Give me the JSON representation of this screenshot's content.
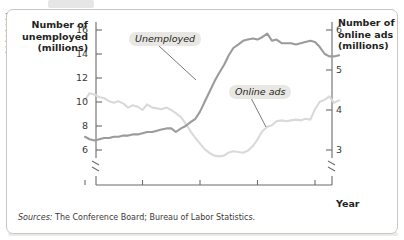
{
  "figure": {
    "panel_border_color": "#c9c6c2",
    "background": "#ffffff"
  },
  "source_note": {
    "lead": "Sources:",
    "text": " The Conference Board; Bureau of Labor Statistics."
  },
  "chart_data": {
    "type": "line",
    "title": "",
    "xlabel": "Year",
    "grid": false,
    "legend_position": "inline-annotations",
    "x_ticks": [
      "2007",
      "2008",
      "2009",
      "2010",
      "2011"
    ],
    "x_tick_values": [
      2007,
      2008,
      2009,
      2010,
      2011
    ],
    "xlim": [
      2006.92,
      2011.55
    ],
    "axis_break_x": true,
    "axes": [
      {
        "side": "left",
        "label": "Number of\nunemployed\n(millions)",
        "label_lines": [
          "Number of",
          "unemployed",
          "(millions)"
        ],
        "ticks": [
          16,
          14,
          12,
          10,
          8,
          6
        ],
        "tick_labels": [
          "16",
          "14",
          "12",
          "10",
          "8",
          "6"
        ],
        "lim": [
          5.0,
          17.0
        ],
        "axis_break": true
      },
      {
        "side": "right",
        "label": "Number of\nonline ads\n(millions)",
        "label_lines": [
          "Number of",
          "online ads",
          "(millions)"
        ],
        "ticks": [
          6,
          5,
          4,
          3
        ],
        "tick_labels": [
          "6",
          "5",
          "4",
          "3"
        ],
        "lim": [
          2.5,
          6.5
        ],
        "axis_break": true
      }
    ],
    "series": [
      {
        "name": "Unemployed",
        "annotation": "Unemployed",
        "axis": "left",
        "color": "#9b9b9b",
        "unit": "millions",
        "x": [
          2007.0,
          2007.08,
          2007.17,
          2007.25,
          2007.33,
          2007.42,
          2007.5,
          2007.58,
          2007.67,
          2007.75,
          2007.83,
          2007.92,
          2008.0,
          2008.08,
          2008.17,
          2008.25,
          2008.33,
          2008.42,
          2008.5,
          2008.58,
          2008.67,
          2008.75,
          2008.83,
          2008.92,
          2009.0,
          2009.08,
          2009.17,
          2009.25,
          2009.33,
          2009.42,
          2009.5,
          2009.58,
          2009.67,
          2009.75,
          2009.83,
          2009.92,
          2010.0,
          2010.08,
          2010.17,
          2010.25,
          2010.33,
          2010.42,
          2010.5,
          2010.58,
          2010.67,
          2010.75,
          2010.83,
          2010.92,
          2011.0,
          2011.08,
          2011.17,
          2011.25,
          2011.33,
          2011.42
        ],
        "y": [
          7.1,
          6.9,
          6.8,
          6.9,
          7.0,
          7.0,
          7.1,
          7.1,
          7.2,
          7.2,
          7.3,
          7.3,
          7.4,
          7.5,
          7.5,
          7.6,
          7.7,
          7.8,
          7.8,
          7.5,
          7.8,
          8.0,
          8.3,
          8.6,
          9.2,
          10.0,
          10.9,
          11.7,
          12.4,
          13.1,
          13.9,
          14.5,
          14.8,
          15.1,
          15.2,
          15.3,
          15.2,
          15.4,
          15.7,
          15.1,
          15.2,
          14.9,
          14.9,
          14.9,
          14.8,
          14.9,
          15.0,
          15.1,
          15.0,
          14.6,
          14.0,
          13.8,
          13.8,
          13.9
        ]
      },
      {
        "name": "Online ads",
        "annotation": "Online ads",
        "axis": "right",
        "color": "#d9d9d9",
        "unit": "millions",
        "x": [
          2007.0,
          2007.08,
          2007.17,
          2007.25,
          2007.33,
          2007.42,
          2007.5,
          2007.58,
          2007.67,
          2007.75,
          2007.83,
          2007.92,
          2008.0,
          2008.08,
          2008.17,
          2008.25,
          2008.33,
          2008.42,
          2008.5,
          2008.58,
          2008.67,
          2008.75,
          2008.83,
          2008.92,
          2009.0,
          2009.08,
          2009.17,
          2009.25,
          2009.33,
          2009.42,
          2009.5,
          2009.58,
          2009.67,
          2009.75,
          2009.83,
          2009.92,
          2010.0,
          2010.08,
          2010.17,
          2010.25,
          2010.33,
          2010.42,
          2010.5,
          2010.58,
          2010.67,
          2010.75,
          2010.83,
          2010.92,
          2011.0,
          2011.08,
          2011.17,
          2011.25,
          2011.33,
          2011.42
        ],
        "y": [
          4.25,
          4.42,
          4.38,
          4.32,
          4.3,
          4.22,
          4.18,
          4.22,
          4.16,
          4.06,
          4.12,
          4.08,
          4.0,
          4.14,
          4.06,
          4.04,
          4.02,
          4.06,
          4.0,
          3.92,
          3.82,
          3.66,
          3.48,
          3.3,
          3.16,
          3.02,
          2.92,
          2.86,
          2.84,
          2.86,
          2.94,
          2.97,
          2.95,
          2.93,
          2.98,
          3.1,
          3.26,
          3.46,
          3.58,
          3.62,
          3.72,
          3.74,
          3.72,
          3.74,
          3.76,
          3.74,
          3.78,
          3.76,
          4.02,
          4.2,
          4.26,
          4.34,
          4.18,
          4.24
        ]
      }
    ]
  }
}
